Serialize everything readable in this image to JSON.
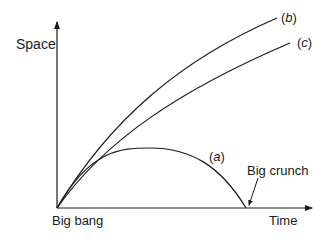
{
  "diagram": {
    "y_axis_label": "Space",
    "x_axis_label": "Time",
    "origin_label": "Big bang",
    "annotation": "Big crunch",
    "curves": [
      {
        "id": "a",
        "label": "(a)",
        "label_italic": "a"
      },
      {
        "id": "b",
        "label": "(b)",
        "label_italic": "b"
      },
      {
        "id": "c",
        "label": "(c)",
        "label_italic": "c"
      }
    ],
    "colors": {
      "stroke": "#1a1a1a",
      "background": "#ffffff"
    }
  }
}
